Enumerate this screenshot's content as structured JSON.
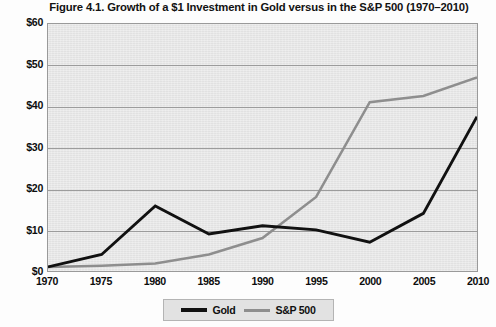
{
  "chart_data": {
    "type": "line",
    "title": "Figure 4.1. Growth of a $1 Investment in Gold versus in the S&P 500 (1970–2010)",
    "xlabel": "",
    "ylabel": "",
    "x": [
      1970,
      1975,
      1980,
      1985,
      1990,
      1995,
      2000,
      2005,
      2010
    ],
    "xtick_labels": [
      "1970",
      "1975",
      "1980",
      "1985",
      "1990",
      "1995",
      "2000",
      "2005",
      "2010"
    ],
    "ytick_labels": [
      "$60",
      "$50",
      "$40",
      "$30",
      "$20",
      "$10",
      "$0"
    ],
    "ytick_values": [
      60,
      50,
      40,
      30,
      20,
      10,
      0
    ],
    "ylim": [
      0,
      60
    ],
    "xlim": [
      1970,
      2010
    ],
    "grid": "horizontal",
    "legend_position": "bottom-center",
    "series": [
      {
        "name": "Gold",
        "color": "#111111",
        "values": [
          1.0,
          4.0,
          15.8,
          9.0,
          11.0,
          10.0,
          7.0,
          14.0,
          37.5
        ]
      },
      {
        "name": "S&P 500",
        "color": "#8e8e8e",
        "values": [
          1.0,
          1.3,
          1.8,
          4.0,
          8.0,
          18.0,
          41.0,
          42.5,
          47.0
        ]
      }
    ]
  },
  "legend": {
    "items": [
      {
        "label": "Gold",
        "swatch": "gold"
      },
      {
        "label": "S&P 500",
        "swatch": "sp"
      }
    ]
  },
  "colors": {
    "plot_background": "#e7e7e7",
    "plot_border": "#9a9a9a",
    "gridline": "#9c9c9c",
    "gold_line": "#111111",
    "sp500_line": "#8e8e8e",
    "text": "#0d0d0d",
    "page_background": "#fdfdfd"
  }
}
